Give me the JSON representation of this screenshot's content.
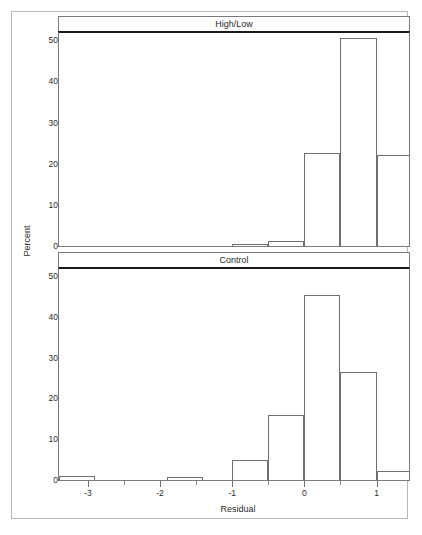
{
  "figure": {
    "background_color": "#ffffff",
    "frame_color": "#b9b9b9",
    "axis_color": "#7a7a7a",
    "bar_edge_color": "#6f6f6f",
    "text_color": "#2b2b2b"
  },
  "chart_data": {
    "type": "bar",
    "title": "",
    "subtitle": "",
    "xlabel": "Residual",
    "ylabel": "Percent",
    "xlim": [
      -3.4,
      1.45
    ],
    "ylim": [
      0,
      52
    ],
    "grid": false,
    "legend_position": "none",
    "bin_width": 0.5,
    "x_ticks": [
      -3,
      -2,
      -1,
      0,
      1
    ],
    "x_tick_labels": [
      "-3",
      "-2",
      "-1",
      "0",
      "1"
    ],
    "x_minor_ticks": [
      -2.5,
      -1.5,
      -0.5,
      0.5
    ],
    "y_ticks": [
      0,
      10,
      20,
      30,
      40,
      50
    ],
    "y_tick_labels": [
      "0",
      "10",
      "20",
      "30",
      "40",
      "50"
    ],
    "panels": [
      {
        "label": "High/Low",
        "bins": [
          {
            "left": -1.0,
            "right": -0.5,
            "value": 0.5
          },
          {
            "left": -0.5,
            "right": 0.0,
            "value": 1.3
          },
          {
            "left": 0.0,
            "right": 0.5,
            "value": 22.7
          },
          {
            "left": 0.5,
            "right": 1.0,
            "value": 50.6
          },
          {
            "left": 1.0,
            "right": 1.5,
            "value": 22.2
          },
          {
            "left": 1.5,
            "right": 2.0,
            "value": 1.3
          }
        ]
      },
      {
        "label": "Control",
        "bins": [
          {
            "left": -3.4,
            "right": -2.9,
            "value": 0.9
          },
          {
            "left": -1.9,
            "right": -1.4,
            "value": 0.7
          },
          {
            "left": -1.0,
            "right": -0.5,
            "value": 4.8
          },
          {
            "left": -0.5,
            "right": 0.0,
            "value": 16.0
          },
          {
            "left": 0.0,
            "right": 0.5,
            "value": 45.5
          },
          {
            "left": 0.5,
            "right": 1.0,
            "value": 26.5
          },
          {
            "left": 1.0,
            "right": 1.5,
            "value": 2.2
          },
          {
            "left": 1.5,
            "right": 2.0,
            "value": 3.0
          }
        ]
      }
    ]
  },
  "panel_geometry": {
    "top": {
      "header_top": 16,
      "plot_top": 31,
      "plot_height": 216
    },
    "bottom": {
      "header_top": 252,
      "plot_top": 267,
      "plot_height": 214
    }
  }
}
